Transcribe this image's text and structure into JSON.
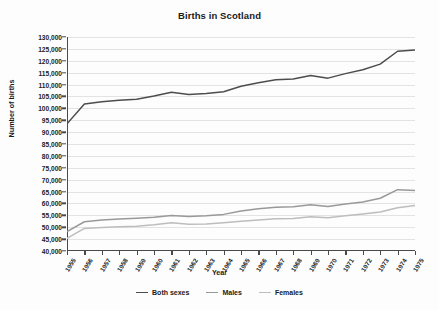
{
  "chart_data": {
    "type": "line",
    "title": "Births in Scotland",
    "xlabel": "Year",
    "ylabel": "Number of births",
    "grid": true,
    "legend_position": "bottom",
    "ylim": [
      40000,
      130000
    ],
    "ytick_step": 5000,
    "ytick_labels": [
      "130,000",
      "125,000",
      "120,000",
      "115,000",
      "110,000",
      "105,000",
      "100,000",
      "95,000",
      "90,000",
      "85,000",
      "80,000",
      "75,000",
      "70,000",
      "65,000",
      "60,000",
      "55,000",
      "50,000",
      "45,000",
      "40,000"
    ],
    "categories": [
      "1955",
      "1956",
      "1957",
      "1958",
      "1959",
      "1960",
      "1961",
      "1962",
      "1963",
      "1964",
      "1965",
      "1966",
      "1967",
      "1968",
      "1969",
      "1970",
      "1971",
      "1972",
      "1973",
      "1974",
      "1975"
    ],
    "series": [
      {
        "name": "Both sexes",
        "color": "#4d4d4d",
        "values": [
          93500,
          101800,
          102800,
          103400,
          103800,
          105200,
          106800,
          105800,
          106200,
          107000,
          109300,
          110800,
          112000,
          112300,
          113800,
          112700,
          114600,
          116200,
          118600,
          124000,
          124500
        ]
      },
      {
        "name": "Males",
        "color": "#999999",
        "values": [
          48200,
          52300,
          53000,
          53500,
          53800,
          54200,
          54900,
          54500,
          54800,
          55400,
          56800,
          57800,
          58400,
          58600,
          59400,
          58700,
          59800,
          60600,
          62200,
          65800,
          65400
        ]
      },
      {
        "name": "Females",
        "color": "#bdbdbd",
        "values": [
          45300,
          49500,
          49900,
          50200,
          50400,
          51000,
          51900,
          51300,
          51400,
          51900,
          52500,
          53000,
          53600,
          53700,
          54400,
          54000,
          54800,
          55600,
          56400,
          58200,
          59100
        ]
      }
    ]
  }
}
